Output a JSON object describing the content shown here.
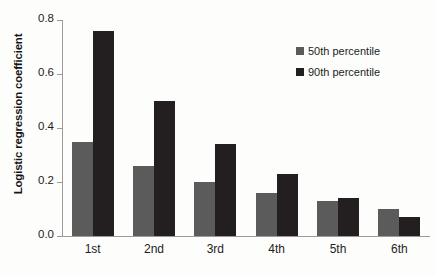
{
  "chart_data": {
    "type": "bar",
    "title": "",
    "xlabel": "",
    "ylabel": "Logistic regression coefficient",
    "categories": [
      "1st",
      "2nd",
      "3rd",
      "4th",
      "5th",
      "6th"
    ],
    "series": [
      {
        "name": "50th percentile",
        "color": "#5b5b5b",
        "values": [
          0.35,
          0.26,
          0.2,
          0.16,
          0.13,
          0.1
        ]
      },
      {
        "name": "90th percentile",
        "color": "#231f20",
        "values": [
          0.76,
          0.5,
          0.34,
          0.23,
          0.14,
          0.07
        ]
      }
    ],
    "ylim": [
      0.0,
      0.8
    ],
    "yticks": [
      "0.0",
      "0.2",
      "0.4",
      "0.6",
      "0.8"
    ],
    "ytick_values": [
      0.0,
      0.2,
      0.4,
      0.6,
      0.8
    ],
    "grid": false,
    "legend_position": "top-right"
  },
  "legend": {
    "items": [
      {
        "label": "50th percentile",
        "swatch": "gray-square-icon"
      },
      {
        "label": "90th percentile",
        "swatch": "black-square-icon"
      }
    ]
  }
}
